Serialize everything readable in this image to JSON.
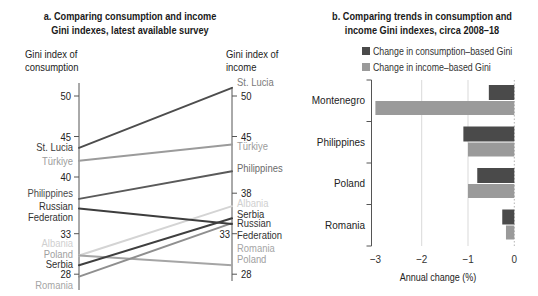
{
  "chart_data": [
    {
      "type": "line",
      "subtype": "slope",
      "title": "a. Comparing consumption and income Gini indexes, latest available survey",
      "title_lines": [
        "a. Comparing consumption and income",
        "Gini indexes, latest available survey"
      ],
      "left_axis_label_lines": [
        "Gini index of",
        "consumption"
      ],
      "right_axis_label_lines": [
        "Gini index of",
        "income"
      ],
      "left_ticks": [
        50,
        45,
        40,
        33,
        28
      ],
      "right_ticks": [
        50,
        45,
        38,
        33,
        28
      ],
      "ylim": [
        27,
        52
      ],
      "grid": false,
      "series": [
        {
          "name": "St. Lucia",
          "label_lines": [
            "St. Lucia"
          ],
          "consumption": 43.6,
          "income": 51.0,
          "color": "#4d4d4d",
          "label_color_left": "#3a3a3a",
          "label_color_right": "#7a7a7a"
        },
        {
          "name": "Türkiye",
          "label_lines": [
            "Türkiye"
          ],
          "consumption": 42.0,
          "income": 44.0,
          "color": "#9b9b9b",
          "label_color_left": "#9b9b9b",
          "label_color_right": "#9b9b9b"
        },
        {
          "name": "Philippines",
          "label_lines": [
            "Philippines"
          ],
          "consumption": 37.3,
          "income": 40.7,
          "color": "#5a5a5a",
          "label_color_left": "#4a4a4a",
          "label_color_right": "#6a6a6a"
        },
        {
          "name": "Russian Federation",
          "label_lines": [
            "Russian",
            "Federation"
          ],
          "consumption": 36.1,
          "income": 34.2,
          "color": "#3d3d3d",
          "label_color_left": "#333333",
          "label_color_right": "#333333"
        },
        {
          "name": "Albania",
          "label_lines": [
            "Albania"
          ],
          "consumption": 30.3,
          "income": 36.4,
          "color": "#d4d4d4",
          "label_color_left": "#cfcfcf",
          "label_color_right": "#cfcfcf"
        },
        {
          "name": "Poland",
          "label_lines": [
            "Poland"
          ],
          "consumption": 30.3,
          "income": 29.1,
          "color": "#a5a5a5",
          "label_color_left": "#a0a0a0",
          "label_color_right": "#a0a0a0"
        },
        {
          "name": "Serbia",
          "label_lines": [
            "Serbia"
          ],
          "consumption": 29.1,
          "income": 34.9,
          "color": "#3f3f3f",
          "label_color_left": "#2f2f2f",
          "label_color_right": "#2f2f2f"
        },
        {
          "name": "Romania",
          "label_lines": [
            "Romania"
          ],
          "consumption": 27.7,
          "income": 34.3,
          "color": "#8f8f8f",
          "label_color_left": "#a5a5a5",
          "label_color_right": "#a5a5a5"
        }
      ]
    },
    {
      "type": "bar",
      "orientation": "horizontal",
      "title": "b. Comparing trends in consumption and income Gini indexes, circa 2008–18",
      "title_lines": [
        "b. Comparing trends in consumption and",
        "income Gini indexes, circa 2008–18"
      ],
      "categories": [
        "Montenegro",
        "Philippines",
        "Poland",
        "Romania"
      ],
      "series": [
        {
          "name": "Change in consumption–based Gini",
          "values": [
            -0.55,
            -1.1,
            -0.8,
            -0.26
          ],
          "color": "#4a4a4a"
        },
        {
          "name": "Change in income–based Gini",
          "values": [
            -3.0,
            -1.0,
            -1.0,
            -0.18
          ],
          "color": "#9a9a9a"
        }
      ],
      "xlabel": "Annual change (%)",
      "ylabel": "",
      "xticks": [
        -3,
        -2,
        -1,
        0
      ],
      "xtick_labels": [
        "−3",
        "−2",
        "−1",
        "0"
      ],
      "xlim": [
        -3.05,
        0
      ],
      "grid": "vertical gridlines at -2 and -1, dotted line at 0",
      "legend": "top-right"
    }
  ]
}
